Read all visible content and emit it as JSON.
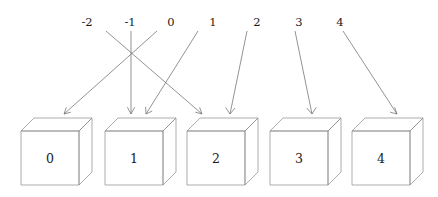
{
  "figure": {
    "colors": {
      "background": "#ffffff",
      "line": "#6f6f6f",
      "cube_edge": "#8a8a8a",
      "text": "#1a1a1a"
    },
    "top_labels": [
      {
        "text": "-2",
        "x": 87
      },
      {
        "text": "-1",
        "x": 130
      },
      {
        "text": "0",
        "x": 171
      },
      {
        "text": "1",
        "x": 213
      },
      {
        "text": "2",
        "x": 257
      },
      {
        "text": "3",
        "x": 299
      },
      {
        "text": "4",
        "x": 340
      }
    ],
    "boxes": [
      {
        "label": "0",
        "x": 21
      },
      {
        "label": "1",
        "x": 105
      },
      {
        "label": "2",
        "x": 187
      },
      {
        "label": "3",
        "x": 270
      },
      {
        "label": "4",
        "x": 352
      }
    ],
    "box_geometry": {
      "front_width": 58,
      "front_height": 54,
      "front_top_y": 131,
      "depth_x": 13,
      "depth_y": 13
    },
    "arrows": [
      {
        "from_label": "-2",
        "to_box": "2",
        "x1": 106,
        "y1": 31,
        "x2": 202,
        "y2": 114
      },
      {
        "from_label": "-1",
        "to_box": "1",
        "x1": 131,
        "y1": 31,
        "x2": 131,
        "y2": 114
      },
      {
        "from_label": "0",
        "to_box": "0",
        "x1": 157,
        "y1": 31,
        "x2": 64,
        "y2": 114
      },
      {
        "from_label": "1",
        "to_box": "1",
        "x1": 198,
        "y1": 31,
        "x2": 146,
        "y2": 114
      },
      {
        "from_label": "2",
        "to_box": "2",
        "x1": 247,
        "y1": 31,
        "x2": 230,
        "y2": 114
      },
      {
        "from_label": "3",
        "to_box": "3",
        "x1": 295,
        "y1": 31,
        "x2": 312,
        "y2": 114
      },
      {
        "from_label": "4",
        "to_box": "4",
        "x1": 343,
        "y1": 31,
        "x2": 397,
        "y2": 114
      }
    ]
  }
}
